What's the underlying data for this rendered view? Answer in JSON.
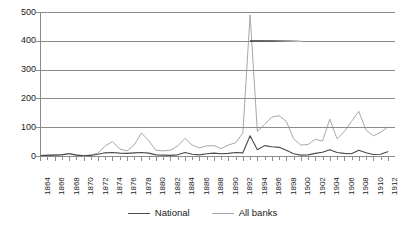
{
  "chart_data": {
    "type": "line",
    "title": "",
    "subtitle": "",
    "xlabel": "",
    "ylabel": "",
    "xlim": [
      1864,
      1913
    ],
    "ylim": [
      0,
      500
    ],
    "ytick_labels": [
      "500",
      "400",
      "300",
      "200",
      "100",
      "0"
    ],
    "ytick_values": [
      500,
      400,
      300,
      200,
      100,
      0
    ],
    "grid": true,
    "legend_position": "bottom-center",
    "x": [
      1864,
      1865,
      1866,
      1867,
      1868,
      1869,
      1870,
      1871,
      1872,
      1873,
      1874,
      1875,
      1876,
      1877,
      1878,
      1879,
      1880,
      1881,
      1882,
      1883,
      1884,
      1885,
      1886,
      1887,
      1888,
      1889,
      1890,
      1891,
      1892,
      1893,
      1894,
      1895,
      1896,
      1897,
      1898,
      1899,
      1900,
      1901,
      1902,
      1903,
      1904,
      1905,
      1906,
      1907,
      1908,
      1909,
      1910,
      1911,
      1912
    ],
    "xtick_labels": [
      "1864",
      "1866",
      "1868",
      "1870",
      "1872",
      "1874",
      "1876",
      "1878",
      "1880",
      "1882",
      "1884",
      "1886",
      "1888",
      "1890",
      "1892",
      "1894",
      "1896",
      "1898",
      "1900",
      "1902",
      "1904",
      "1906",
      "1908",
      "1910",
      "1912"
    ],
    "series": [
      {
        "name": "National",
        "color": "#4a4a4a",
        "values": [
          1,
          2,
          3,
          4,
          8,
          3,
          1,
          2,
          6,
          11,
          12,
          10,
          9,
          11,
          12,
          10,
          4,
          3,
          2,
          4,
          12,
          6,
          4,
          8,
          10,
          8,
          9,
          12,
          11,
          70,
          22,
          36,
          32,
          30,
          20,
          8,
          3,
          4,
          9,
          13,
          22,
          12,
          9,
          8,
          20,
          11,
          5,
          6,
          15
        ]
      },
      {
        "name": "All banks",
        "color": "#a8a8a8",
        "values": [
          3,
          3,
          4,
          5,
          9,
          4,
          2,
          3,
          10,
          35,
          50,
          24,
          18,
          38,
          80,
          54,
          20,
          18,
          20,
          35,
          61,
          38,
          28,
          35,
          36,
          26,
          38,
          46,
          80,
          490,
          85,
          110,
          135,
          140,
          120,
          60,
          38,
          40,
          58,
          52,
          128,
          60,
          85,
          120,
          155,
          90,
          70,
          82,
          100
        ]
      }
    ]
  },
  "legend": {
    "items": [
      {
        "label": "National",
        "color": "#4a4a4a"
      },
      {
        "label": "All banks",
        "color": "#a8a8a8"
      }
    ]
  },
  "axis_colors": {
    "gridline": "#8c8c8c",
    "tick": "#8c8c8c",
    "text": "#1a1a1a"
  },
  "artifact": {
    "name": "scan-smudge-on-400-gridline",
    "start_year": 1893,
    "end_year": 1900,
    "at_value": 400
  }
}
